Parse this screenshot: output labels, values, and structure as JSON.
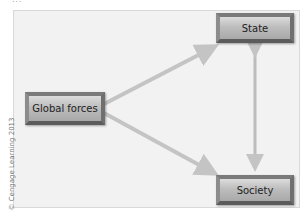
{
  "diagram": {
    "top_caption_fragment": "...",
    "nodes": {
      "state": "State",
      "global_forces": "Global forces",
      "society": "Society"
    },
    "edges": [
      {
        "from": "Global forces",
        "to": "State",
        "direction": "one-way"
      },
      {
        "from": "Global forces",
        "to": "Society",
        "direction": "one-way"
      },
      {
        "from": "State",
        "to": "Society",
        "direction": "two-way"
      }
    ],
    "colors": {
      "background": "#f2f2f2",
      "arrow": "#c4c4c4",
      "node_fill": "#bdbdbd"
    },
    "credit": "© Cengage Learning 2013"
  }
}
